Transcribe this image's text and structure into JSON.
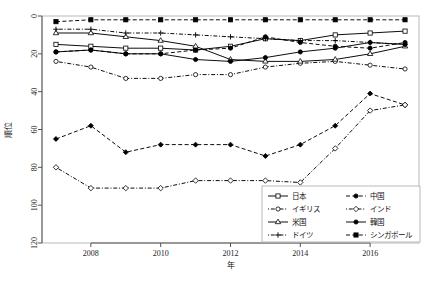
{
  "chart_data": {
    "type": "line",
    "title": "",
    "xlabel": "年",
    "ylabel": "順位",
    "x": [
      2007,
      2008,
      2009,
      2010,
      2011,
      2012,
      2013,
      2014,
      2015,
      2016,
      2017
    ],
    "xlim": [
      2006.6,
      2017.4
    ],
    "ylim": [
      0,
      120
    ],
    "y_reversed": true,
    "xticks": [
      2008,
      2010,
      2012,
      2014,
      2016
    ],
    "yticks": [
      0,
      20,
      40,
      60,
      80,
      100,
      120
    ],
    "grid": false,
    "legend_position": "bottom-right",
    "series": [
      {
        "name": "日本",
        "marker": "open-square",
        "linestyle": "solid",
        "values": [
          15,
          16,
          17,
          17,
          18,
          16,
          12,
          13,
          10,
          9,
          8
        ]
      },
      {
        "name": "中国",
        "marker": "filled-circle",
        "linestyle": "dashed",
        "values": [
          19,
          18,
          20,
          20,
          18,
          17,
          11,
          14,
          16,
          17,
          14
        ]
      },
      {
        "name": "イギリス",
        "marker": "open-circle",
        "linestyle": "dotdash",
        "values": [
          24,
          27,
          33,
          33,
          31,
          31,
          27,
          25,
          24,
          26,
          28
        ]
      },
      {
        "name": "インド",
        "marker": "open-diamond",
        "linestyle": "dotdash",
        "values": [
          80,
          91,
          91,
          91,
          87,
          87,
          87,
          88,
          78,
          70,
          47
        ]
      },
      {
        "name": "米国",
        "marker": "open-triangle",
        "linestyle": "solid",
        "values": [
          9,
          9,
          11,
          13,
          16,
          23,
          24,
          24,
          23,
          20,
          16
        ]
      },
      {
        "name": "韓国",
        "marker": "filled-circle",
        "linestyle": "solid",
        "values": [
          19,
          18,
          20,
          20,
          23,
          24,
          22,
          19,
          17,
          14,
          15
        ]
      },
      {
        "name": "ドイツ",
        "marker": "plus",
        "linestyle": "dotdash",
        "values": [
          7,
          7,
          9,
          9,
          10,
          11,
          12,
          13,
          13,
          14,
          15
        ]
      },
      {
        "name": "シンガポール",
        "marker": "filled-square",
        "linestyle": "dashed",
        "values": [
          3,
          2,
          2,
          2,
          2,
          2,
          2,
          2,
          2,
          2,
          2
        ]
      }
    ],
    "lower_series": [
      {
        "name": "ドイツ",
        "marker": "filled-diamond",
        "linestyle": "dashed",
        "values": [
          65,
          58,
          72,
          68,
          68,
          68,
          74,
          68,
          58,
          41,
          47
        ]
      },
      {
        "name": "インド",
        "marker": "open-diamond",
        "linestyle": "dotdash",
        "values": [
          80,
          91,
          91,
          91,
          87,
          87,
          87,
          88,
          70,
          50,
          47
        ]
      }
    ]
  },
  "legend": {
    "entries": [
      {
        "label": "日本",
        "marker": "open-square",
        "style": "solid"
      },
      {
        "label": "中国",
        "marker": "filled-circle",
        "style": "dashed"
      },
      {
        "label": "イギリス",
        "marker": "open-circle",
        "style": "dotdash"
      },
      {
        "label": "インド",
        "marker": "open-diamond",
        "style": "dotdash"
      },
      {
        "label": "米国",
        "marker": "open-triangle",
        "style": "solid"
      },
      {
        "label": "韓国",
        "marker": "filled-circle",
        "style": "solid"
      },
      {
        "label": "ドイツ",
        "marker": "plus",
        "style": "dotdash"
      },
      {
        "label": "シンガポール",
        "marker": "filled-square",
        "style": "dashed"
      }
    ]
  }
}
